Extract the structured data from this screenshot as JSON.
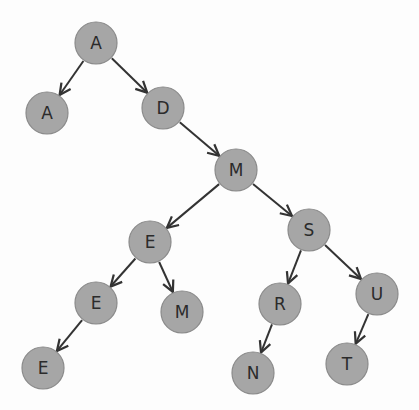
{
  "diagram": {
    "type": "tree",
    "node_fill": "#a6a6a6",
    "edge_color": "#333333",
    "node_radius": 21,
    "nodes": [
      {
        "id": "n1",
        "label": "A",
        "x": 96,
        "y": 43
      },
      {
        "id": "n2",
        "label": "A",
        "x": 47,
        "y": 113
      },
      {
        "id": "n3",
        "label": "D",
        "x": 163,
        "y": 108
      },
      {
        "id": "n4",
        "label": "M",
        "x": 236,
        "y": 170
      },
      {
        "id": "n5",
        "label": "E",
        "x": 150,
        "y": 242
      },
      {
        "id": "n6",
        "label": "S",
        "x": 309,
        "y": 230
      },
      {
        "id": "n7",
        "label": "E",
        "x": 96,
        "y": 303
      },
      {
        "id": "n8",
        "label": "M",
        "x": 182,
        "y": 312
      },
      {
        "id": "n9",
        "label": "R",
        "x": 280,
        "y": 304
      },
      {
        "id": "n10",
        "label": "U",
        "x": 377,
        "y": 294
      },
      {
        "id": "n11",
        "label": "E",
        "x": 43,
        "y": 368
      },
      {
        "id": "n12",
        "label": "N",
        "x": 253,
        "y": 373
      },
      {
        "id": "n13",
        "label": "T",
        "x": 347,
        "y": 364
      }
    ],
    "edges": [
      {
        "from": "n1",
        "to": "n2"
      },
      {
        "from": "n1",
        "to": "n3"
      },
      {
        "from": "n3",
        "to": "n4"
      },
      {
        "from": "n4",
        "to": "n5"
      },
      {
        "from": "n4",
        "to": "n6"
      },
      {
        "from": "n5",
        "to": "n7"
      },
      {
        "from": "n5",
        "to": "n8"
      },
      {
        "from": "n6",
        "to": "n9"
      },
      {
        "from": "n6",
        "to": "n10"
      },
      {
        "from": "n7",
        "to": "n11"
      },
      {
        "from": "n9",
        "to": "n12"
      },
      {
        "from": "n10",
        "to": "n13"
      }
    ]
  }
}
